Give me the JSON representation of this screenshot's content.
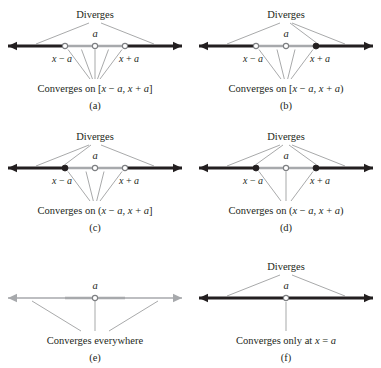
{
  "figure": {
    "colors": {
      "diverge_line": "#231f20",
      "converge_line": "#a7a9ac",
      "leader_line": "#6d6e71",
      "text": "#231f20",
      "background": "#ffffff"
    },
    "common": {
      "diverges_label": "Diverges",
      "center_label": "a",
      "left_tick_label": "x − a",
      "right_tick_label": "x + a"
    }
  },
  "panels": [
    {
      "id": "a",
      "letter": "(a)",
      "diverges_label": "Diverges",
      "center_label": "a",
      "left_tick_label": "x − a",
      "right_tick_label": "x + a",
      "caption": "Converges on [x − a, x + a]",
      "left_endpoint": "open",
      "right_endpoint": "open",
      "center_endpoint": "open",
      "outer_rays": "diverge",
      "inner_segment": "converge",
      "diverges_leaders": 2,
      "caption_fan": 5
    },
    {
      "id": "b",
      "letter": "(b)",
      "diverges_label": "Diverges",
      "center_label": "a",
      "left_tick_label": "x − a",
      "right_tick_label": "x + a",
      "caption": "Converges on [x − a, x + a)",
      "left_endpoint": "open",
      "right_endpoint": "filled",
      "center_endpoint": "open",
      "outer_rays": "diverge",
      "inner_segment": "converge",
      "diverges_leaders": 3,
      "caption_fan": 4
    },
    {
      "id": "c",
      "letter": "(c)",
      "diverges_label": "Diverges",
      "center_label": "a",
      "left_tick_label": "x − a",
      "right_tick_label": "x + a",
      "caption": "Converges on (x − a, x + a]",
      "left_endpoint": "filled",
      "right_endpoint": "open",
      "center_endpoint": "open",
      "outer_rays": "diverge",
      "inner_segment": "converge",
      "diverges_leaders": 3,
      "caption_fan": 4
    },
    {
      "id": "d",
      "letter": "(d)",
      "diverges_label": "Diverges",
      "center_label": "a",
      "left_tick_label": "x − a",
      "right_tick_label": "x + a",
      "caption": "Converges on (x − a, x + a)",
      "left_endpoint": "filled",
      "right_endpoint": "filled",
      "center_endpoint": "open",
      "outer_rays": "diverge",
      "inner_segment": "converge",
      "diverges_leaders": 4,
      "caption_fan": 3
    },
    {
      "id": "e",
      "letter": "(e)",
      "diverges_label": "",
      "center_label": "a",
      "left_tick_label": "",
      "right_tick_label": "",
      "caption": "Converges everywhere",
      "left_endpoint": "none",
      "right_endpoint": "none",
      "center_endpoint": "open",
      "outer_rays": "converge",
      "inner_segment": "converge",
      "diverges_leaders": 0,
      "caption_fan": 3
    },
    {
      "id": "f",
      "letter": "(f)",
      "diverges_label": "Diverges",
      "center_label": "a",
      "left_tick_label": "",
      "right_tick_label": "",
      "caption": "Converges only at x = a",
      "left_endpoint": "none",
      "right_endpoint": "none",
      "center_endpoint": "open",
      "outer_rays": "diverge",
      "inner_segment": "diverge",
      "diverges_leaders": 2,
      "caption_fan": 1
    }
  ]
}
